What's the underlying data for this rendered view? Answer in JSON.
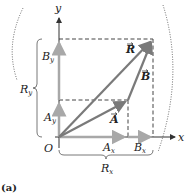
{
  "figure": {
    "caption": "(a)",
    "axes": {
      "x_label": "x",
      "y_label": "y",
      "origin_label": "O"
    },
    "vectors": [
      {
        "name": "A",
        "label": "A",
        "from": [
          0,
          0
        ],
        "to": [
          69,
          37
        ]
      },
      {
        "name": "B",
        "label": "B",
        "from": [
          69,
          37
        ],
        "to": [
          94,
          98
        ]
      },
      {
        "name": "R",
        "label": "R",
        "from": [
          0,
          0
        ],
        "to": [
          94,
          98
        ]
      }
    ],
    "components": {
      "Ax": {
        "main": "A",
        "sub": "x"
      },
      "Bx": {
        "main": "B",
        "sub": "x"
      },
      "Ay": {
        "main": "A",
        "sub": "y"
      },
      "By": {
        "main": "B",
        "sub": "y"
      },
      "Rx": {
        "main": "R",
        "sub": "x"
      },
      "Ry": {
        "main": "R",
        "sub": "y"
      }
    },
    "colors": {
      "vector": "#7a7a7a",
      "component": "#a8a8a8",
      "axis": "#333333",
      "dashed": "#444444"
    }
  }
}
